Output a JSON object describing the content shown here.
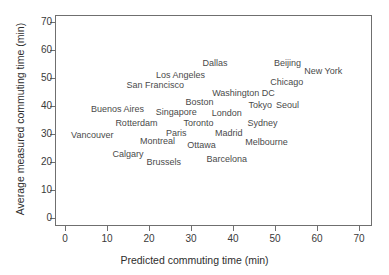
{
  "chart_data": {
    "type": "scatter",
    "title": "",
    "xlabel": "Predicted commuting time (min)",
    "ylabel": "Average measured commuting time (min)",
    "xlim": [
      -1.5,
      73
    ],
    "ylim": [
      -2.5,
      74
    ],
    "xticks": [
      0,
      10,
      20,
      30,
      40,
      50,
      60,
      70
    ],
    "yticks": [
      0,
      10,
      20,
      30,
      40,
      50,
      60,
      70
    ],
    "xticklabels": [
      "0",
      "10",
      "20",
      "30",
      "40",
      "50",
      "60",
      "70"
    ],
    "yticklabels": [
      "0",
      "10",
      "20",
      "30",
      "40",
      "50",
      "60",
      "70"
    ],
    "grid": false,
    "legend": null,
    "marker_style": "text-label",
    "text_color": "#4a4a4a",
    "axis_color": "#6f6f6f",
    "points": [
      {
        "label": "Dallas",
        "x": 35.7,
        "y": 55.5
      },
      {
        "label": "Beijing",
        "x": 53.0,
        "y": 55.5
      },
      {
        "label": "New York",
        "x": 61.5,
        "y": 52.5
      },
      {
        "label": "Los Angeles",
        "x": 27.5,
        "y": 51.0
      },
      {
        "label": "Chicago",
        "x": 52.8,
        "y": 48.5
      },
      {
        "label": "San Francisco",
        "x": 21.5,
        "y": 47.5
      },
      {
        "label": "Washington DC",
        "x": 42.5,
        "y": 44.5
      },
      {
        "label": "Boston",
        "x": 32.0,
        "y": 41.5
      },
      {
        "label": "Tokyo",
        "x": 46.5,
        "y": 40.5
      },
      {
        "label": "Seoul",
        "x": 53.0,
        "y": 40.5
      },
      {
        "label": "Buenos Aires",
        "x": 12.5,
        "y": 39.0
      },
      {
        "label": "Singapore",
        "x": 26.5,
        "y": 38.0
      },
      {
        "label": "London",
        "x": 38.5,
        "y": 37.5
      },
      {
        "label": "Rotterdam",
        "x": 17.0,
        "y": 34.0
      },
      {
        "label": "Toronto",
        "x": 31.8,
        "y": 34.0
      },
      {
        "label": "Sydney",
        "x": 47.0,
        "y": 34.0
      },
      {
        "label": "Paris",
        "x": 26.5,
        "y": 30.5
      },
      {
        "label": "Madrid",
        "x": 39.0,
        "y": 30.5
      },
      {
        "label": "Vancouver",
        "x": 6.5,
        "y": 29.5
      },
      {
        "label": "Montreal",
        "x": 22.0,
        "y": 27.5
      },
      {
        "label": "Melbourne",
        "x": 48.0,
        "y": 27.0
      },
      {
        "label": "Ottawa",
        "x": 32.5,
        "y": 26.0
      },
      {
        "label": "Calgary",
        "x": 15.0,
        "y": 23.0
      },
      {
        "label": "Brussels",
        "x": 23.5,
        "y": 20.0
      },
      {
        "label": "Barcelona",
        "x": 38.5,
        "y": 21.0
      }
    ]
  }
}
